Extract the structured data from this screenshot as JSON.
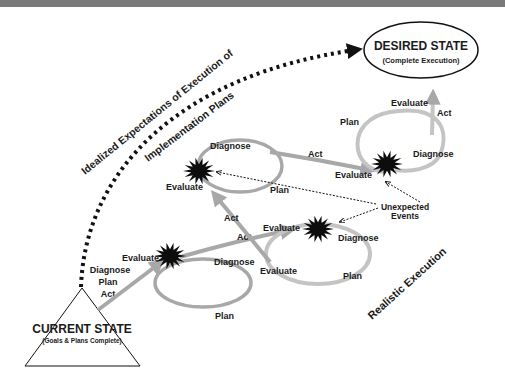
{
  "title_bar": "",
  "desired_state": {
    "title": "DESIRED STATE",
    "subtitle": "(Complete Execution)"
  },
  "current_state": {
    "title": "CURRENT STATE",
    "subtitle": "(Goals & Plans Complete)",
    "steps": [
      "Diagnose",
      "Plan",
      "Act"
    ]
  },
  "idealized": {
    "line1": "Idealized Expectations of Execution of",
    "line2": "Implementation Plans"
  },
  "realistic_label": "Realistic Execution",
  "unexpected_events": {
    "line1": "Unexpected",
    "line2": "Events"
  },
  "loops": {
    "loop1": {
      "evaluate": "Evaluate",
      "diagnose": "Diagnose",
      "plan": "Plan",
      "act": "Act"
    },
    "loop2": {
      "evaluate_top": "Evaluate",
      "diagnose": "Diagnose",
      "evaluate_bottom": "Evaluate",
      "plan": "Plan",
      "act": "Act"
    },
    "loop3": {
      "evaluate": "Evaluate",
      "diagnose": "Diagnose",
      "plan": "Plan",
      "act": "Act"
    },
    "loop4": {
      "plan": "Plan",
      "evaluate_top": "Evaluate",
      "act": "Act",
      "diagnose": "Diagnose",
      "evaluate": "Evaluate"
    }
  },
  "colors": {
    "arrow_gray": "#a8a8a8",
    "star_black": "#0d0d0d",
    "text": "#1a1a1a",
    "top_bar": "#7a7a7a"
  }
}
